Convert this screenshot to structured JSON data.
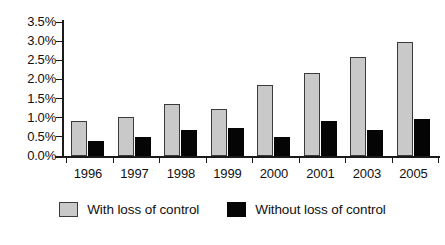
{
  "chart_data": {
    "type": "bar",
    "title": "",
    "subtitle": "",
    "xlabel": "",
    "ylabel": "",
    "categories": [
      "1996",
      "1997",
      "1998",
      "1999",
      "2000",
      "2001",
      "2003",
      "2005"
    ],
    "series": [
      {
        "name": "With loss of control",
        "color": "#c9c9c9",
        "values": [
          0.91,
          1.02,
          1.36,
          1.23,
          1.86,
          2.18,
          2.59,
          2.98
        ]
      },
      {
        "name": "Without loss of control",
        "color": "#050505",
        "values": [
          0.4,
          0.5,
          0.68,
          0.73,
          0.5,
          0.92,
          0.68,
          0.97
        ]
      }
    ],
    "ylim": [
      0,
      3.5
    ],
    "yticks": [
      0.0,
      0.5,
      1.0,
      1.5,
      2.0,
      2.5,
      3.0,
      3.5
    ],
    "ytick_labels": [
      "0.0%",
      "0.5%",
      "1.0%",
      "1.5%",
      "2.0%",
      "2.5%",
      "3.0%",
      "3.5%"
    ],
    "grid": false,
    "legend_position": "bottom"
  },
  "legend": {
    "items": [
      {
        "label": "With loss of control",
        "swatch": "gray-swatch"
      },
      {
        "label": "Without loss of control",
        "swatch": "black-swatch"
      }
    ]
  }
}
